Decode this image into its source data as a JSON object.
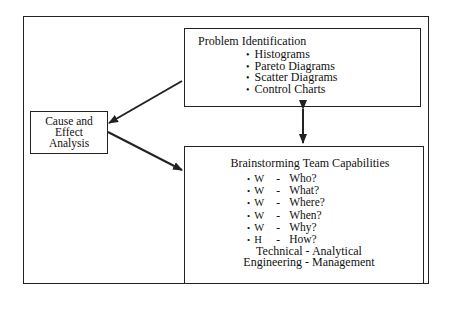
{
  "diagram": {
    "cause_effect": {
      "lines": [
        "Cause and",
        "Effect",
        "Analysis"
      ]
    },
    "problem_identification": {
      "title": "Problem Identification",
      "items": [
        "Histograms",
        "Pareto Diagrams",
        "Scatter Diagrams",
        "Control Charts"
      ]
    },
    "brainstorming": {
      "title": "Brainstorming Team Capabilities",
      "items": [
        {
          "letter": "W",
          "dash": "-",
          "question": "Who?"
        },
        {
          "letter": "W",
          "dash": "-",
          "question": "What?"
        },
        {
          "letter": "W",
          "dash": "-",
          "question": "Where?"
        },
        {
          "letter": "W",
          "dash": "-",
          "question": "When?"
        },
        {
          "letter": "W",
          "dash": "-",
          "question": "Why?"
        },
        {
          "letter": "H",
          "dash": "-",
          "question": "How?"
        }
      ],
      "footer_lines": [
        "Technical - Analytical",
        "Engineering - Management"
      ]
    },
    "connections": [
      {
        "from": "problem_identification",
        "to": "cause_effect",
        "type": "arrow"
      },
      {
        "from": "cause_effect",
        "to": "brainstorming",
        "type": "arrow"
      },
      {
        "from": "problem_identification",
        "to": "brainstorming",
        "type": "double-arrow"
      }
    ],
    "colors": {
      "line": "#222222",
      "background": "#ffffff"
    }
  }
}
